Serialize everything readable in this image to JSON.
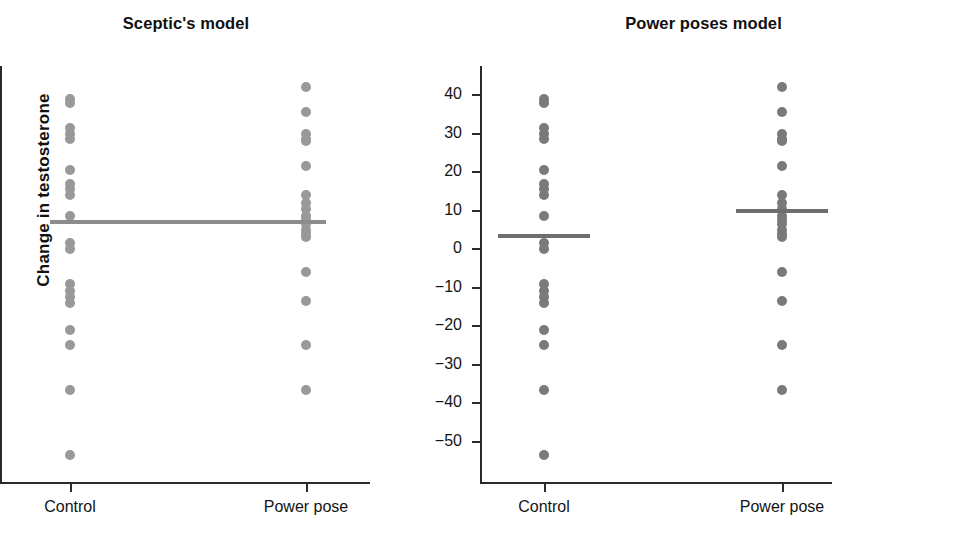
{
  "figure": {
    "ylabel": "Change in testosterone",
    "panels": [
      {
        "id": "sceptic",
        "title": "Sceptic's model",
        "dot_color": "#999999",
        "mean_color": "#8c8c8c"
      },
      {
        "id": "power-poses",
        "title": "Power poses model",
        "dot_color": "#7a7a7a",
        "mean_color": "#6e6e6e"
      }
    ]
  },
  "chart_data": {
    "type": "scatter",
    "xlabel": "",
    "ylabel": "Change in testosterone",
    "grid": false,
    "legend": false,
    "ylim": [
      -58,
      46
    ],
    "yticks": [
      40,
      30,
      20,
      10,
      0,
      -10,
      -20,
      -30,
      -40,
      -50
    ],
    "ytick_labels": [
      "40",
      "30",
      "20",
      "10",
      "0",
      "−10",
      "−20",
      "−30",
      "−40",
      "−50"
    ],
    "categories": [
      "Control",
      "Power pose"
    ],
    "panels": [
      {
        "name": "Sceptic's model",
        "series": [
          {
            "name": "Control",
            "values": [
              39,
              38,
              31.5,
              30,
              28.5,
              20.5,
              17,
              15.5,
              14,
              8.5,
              1.5,
              0,
              -9,
              -11,
              -12.5,
              -14,
              -21,
              -25,
              -36.5,
              -53.5
            ]
          },
          {
            "name": "Power pose",
            "values": [
              42,
              35.5,
              30,
              28.5,
              28,
              21.5,
              14,
              12,
              10.5,
              8.5,
              7.5,
              6.5,
              5,
              4,
              3,
              -6,
              -13.5,
              -25,
              -36.5
            ]
          }
        ],
        "means": [
          {
            "group": "Control",
            "value": 7
          },
          {
            "group": "Power pose",
            "value": 7
          }
        ]
      },
      {
        "name": "Power poses model",
        "series": [
          {
            "name": "Control",
            "values": [
              39,
              38,
              31.5,
              30,
              28.5,
              20.5,
              17,
              15.5,
              14,
              8.5,
              1.5,
              0,
              -9,
              -11,
              -12.5,
              -14,
              -21,
              -25,
              -36.5,
              -53.5
            ]
          },
          {
            "name": "Power pose",
            "values": [
              42,
              35.5,
              30,
              28.5,
              28,
              21.5,
              14,
              12,
              10.5,
              8.5,
              7.5,
              6.5,
              5,
              4,
              3,
              -6,
              -13.5,
              -25,
              -36.5
            ]
          }
        ],
        "means": [
          {
            "group": "Control",
            "value": 3.5
          },
          {
            "group": "Power pose",
            "value": 10
          }
        ]
      }
    ]
  }
}
